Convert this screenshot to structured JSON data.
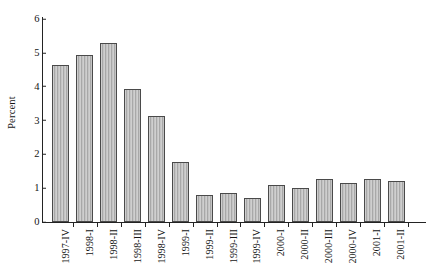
{
  "chart_data": {
    "type": "bar",
    "title": "",
    "xlabel": "",
    "ylabel": "Percent",
    "ylim": [
      0,
      6
    ],
    "yticks": [
      0,
      1,
      2,
      3,
      4,
      5,
      6
    ],
    "ytick_labels": [
      "0",
      "1",
      "2",
      "3",
      "4",
      "5",
      "6"
    ],
    "grid": false,
    "legend": "none",
    "bar_fill": "#b9b9b9",
    "bar_edge": "#4a4a4a",
    "categories": [
      "1997-IV",
      "1998-I",
      "1998-II",
      "1998-III",
      "1998-IV",
      "1999-I",
      "1999-II",
      "1999-III",
      "1999-IV",
      "2000-I",
      "2000-II",
      "2000-III",
      "2000-IV",
      "2001-I",
      "2001-II"
    ],
    "values": [
      4.63,
      4.94,
      5.28,
      3.93,
      3.12,
      1.76,
      0.81,
      0.87,
      0.72,
      1.08,
      1.0,
      1.28,
      1.14,
      1.28,
      1.2
    ]
  }
}
